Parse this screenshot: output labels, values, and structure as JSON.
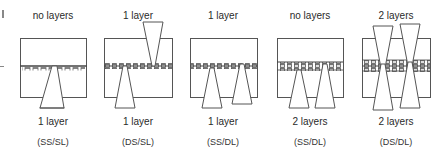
{
  "diagram": {
    "panels": [
      {
        "top_label": "no layers",
        "bottom_label": "1 layer",
        "format": "(SS/SL)",
        "cx": 53
      },
      {
        "top_label": "1 layer",
        "bottom_label": "1 layer",
        "format": "(DS/SL)",
        "cx": 138
      },
      {
        "top_label": "1 layer",
        "bottom_label": "1 layer",
        "format": "(SS/DL)",
        "cx": 223
      },
      {
        "top_label": "no layers",
        "bottom_label": "2 layers",
        "format": "(SS/DL)",
        "cx": 310
      },
      {
        "top_label": "2 layers",
        "bottom_label": "2 layers",
        "format": "(DS/DL)",
        "cx": 396
      }
    ],
    "colors": {
      "line": "#555555",
      "band": "#777777"
    }
  }
}
